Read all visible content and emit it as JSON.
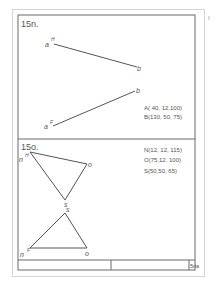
{
  "sheet": {
    "problem_15n": {
      "title": "15n.",
      "elevation_line": {
        "start_label": "a",
        "start_sup": "H",
        "end_label": "b"
      },
      "plan_line": {
        "start_label": "a",
        "start_sup": "F",
        "end_label": "b"
      },
      "coordinates": [
        "A( 40, 12,100)",
        "B(130, 50, 75)"
      ]
    },
    "problem_15o": {
      "title": "15o.",
      "elevation_triangle": {
        "n_label": "n",
        "n_sup": "H",
        "o_label": "o",
        "s_label": "s"
      },
      "plan_triangle": {
        "n_label": "n",
        "n_sup": "F",
        "o_label": "o",
        "s_label": "s"
      },
      "coordinates": [
        "N(12, 12, 115)",
        "O(75,12, 100)",
        "S(50,50, 65)"
      ]
    },
    "title_block": {
      "cells": [
        "",
        "",
        "5na"
      ]
    }
  },
  "colors": {
    "line": "#555555",
    "frame": "#6a6a6a",
    "page_border": "#d4d4d4"
  }
}
